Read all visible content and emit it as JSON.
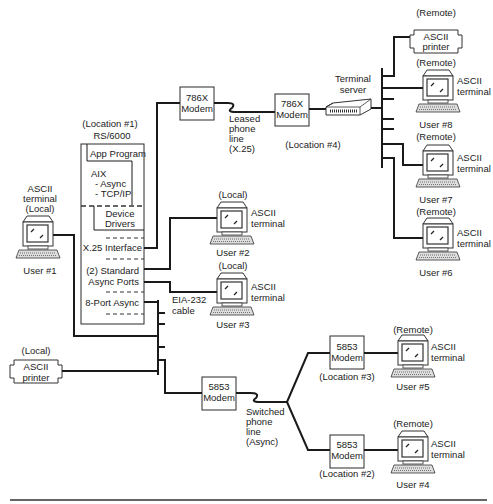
{
  "rs6000": {
    "location": "(Location #1)",
    "title": "RS/6000",
    "app_program": "App Program",
    "aix": "AIX",
    "aix_async": "- Async",
    "aix_tcpip": "- TCP/IP",
    "device_drivers_1": "Device",
    "device_drivers_2": "Drivers",
    "x25_interface": "X.25 Interface",
    "std_async_1": "(2) Standard",
    "std_async_2": "Async Ports",
    "eight_port": "8-Port Async"
  },
  "user1": {
    "line1": "ASCII",
    "line2": "terminal",
    "line3": "(Local)",
    "user": "User #1"
  },
  "user2": {
    "qualifier": "(Local)",
    "line1": "ASCII",
    "line2": "terminal",
    "user": "User #2"
  },
  "user3": {
    "qualifier": "(Local)",
    "line1": "ASCII",
    "line2": "terminal",
    "user": "User #3"
  },
  "cable": {
    "line1": "EIA-232",
    "line2": "cable"
  },
  "local_printer": {
    "qualifier": "(Local)",
    "line1": "ASCII",
    "line2": "printer"
  },
  "modem_786x_a": {
    "line1": "786X",
    "line2": "Modem"
  },
  "leased_line": {
    "line1": "Leased",
    "line2": "phone",
    "line3": "line",
    "line4": "(X.25)"
  },
  "modem_786x_b": {
    "line1": "786X",
    "line2": "Modem"
  },
  "terminal_server": {
    "line1": "Terminal",
    "line2": "server"
  },
  "location4": "(Location #4)",
  "remote_printer": {
    "qualifier": "(Remote)",
    "line1": "ASCII",
    "line2": "printer"
  },
  "user8": {
    "qualifier": "(Remote)",
    "line1": "ASCII",
    "line2": "terminal",
    "user": "User #8"
  },
  "user7": {
    "qualifier": "(Remote)",
    "line1": "ASCII",
    "line2": "terminal",
    "user": "User #7"
  },
  "user6": {
    "qualifier": "(Remote)",
    "line1": "ASCII",
    "line2": "terminal",
    "user": "User #6"
  },
  "modem_5853_main": {
    "line1": "5853",
    "line2": "Modem"
  },
  "switched_line": {
    "line1": "Switched",
    "line2": "phone",
    "line3": "line",
    "line4": "(Async)"
  },
  "modem_5853_loc3": {
    "line1": "5853",
    "line2": "Modem",
    "location": "(Location #3)"
  },
  "modem_5853_loc2": {
    "line1": "5853",
    "line2": "Modem",
    "location": "(Location #2)"
  },
  "user5": {
    "qualifier": "(Remote)",
    "line1": "ASCII",
    "line2": "terminal",
    "user": "User #5"
  },
  "user4": {
    "qualifier": "(Remote)",
    "line1": "ASCII",
    "line2": "terminal",
    "user": "User #4"
  }
}
